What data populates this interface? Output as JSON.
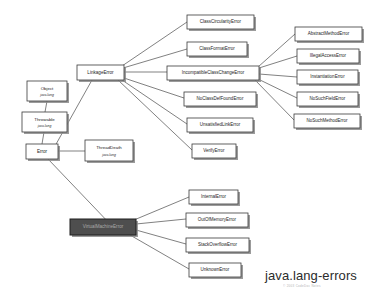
{
  "diagram": {
    "title": "java.lang-errors",
    "subtitle": "© 2003 CodeDoc Notes",
    "canvas": {
      "width": 373,
      "height": 301,
      "background": "#ffffff"
    },
    "style": {
      "box_fill": "#ffffff",
      "box_stroke": "#3a3a3a",
      "shadow_fill": "#8a8a8a",
      "edge_stroke": "#4a4a4a",
      "selected_fill": "#4e4e4e",
      "selected_text": "#a9a9a9"
    },
    "nodes": [
      {
        "id": "object",
        "label": "Object",
        "sublabel": "java.lang",
        "x": 27,
        "y": 81,
        "w": 40,
        "h": 20,
        "selected": false,
        "font": 4.4,
        "subfont": 3.4
      },
      {
        "id": "throwable",
        "label": "Throwable",
        "sublabel": "java.lang",
        "x": 22,
        "y": 112,
        "w": 45,
        "h": 20,
        "selected": false,
        "font": 4.4,
        "subfont": 3.4
      },
      {
        "id": "error",
        "label": "Error",
        "sublabel": "",
        "x": 26,
        "y": 144,
        "w": 32,
        "h": 15,
        "selected": false,
        "font": 4.6,
        "subfont": 0
      },
      {
        "id": "threaddeath",
        "label": "ThreadDeath",
        "sublabel": "java.lang",
        "x": 85,
        "y": 140,
        "w": 48,
        "h": 21,
        "selected": false,
        "font": 4.4,
        "subfont": 3.4
      },
      {
        "id": "linkageerror",
        "label": "LinkageError",
        "sublabel": "",
        "x": 77,
        "y": 65,
        "w": 47,
        "h": 15,
        "selected": false,
        "font": 4.6,
        "subfont": 0
      },
      {
        "id": "classcircularityerror",
        "label": "ClassCircularityError",
        "sublabel": "",
        "x": 187,
        "y": 15,
        "w": 67,
        "h": 14,
        "selected": false,
        "font": 4.5,
        "subfont": 0
      },
      {
        "id": "classformaterror",
        "label": "ClassFormatError",
        "sublabel": "",
        "x": 187,
        "y": 42,
        "w": 60,
        "h": 14,
        "selected": false,
        "font": 4.5,
        "subfont": 0
      },
      {
        "id": "incompatibleclasschangeerror",
        "label": "IncompatibleClassChangeError",
        "sublabel": "",
        "x": 167,
        "y": 66,
        "w": 92,
        "h": 14,
        "selected": false,
        "font": 4.5,
        "subfont": 0
      },
      {
        "id": "noclassdeffounderror",
        "label": "NoClassDefFoundError",
        "sublabel": "",
        "x": 184,
        "y": 92,
        "w": 72,
        "h": 14,
        "selected": false,
        "font": 4.5,
        "subfont": 0
      },
      {
        "id": "unsatisfiedlinkerror",
        "label": "UnsatisfiedLinkError",
        "sublabel": "",
        "x": 187,
        "y": 118,
        "w": 66,
        "h": 14,
        "selected": false,
        "font": 4.5,
        "subfont": 0
      },
      {
        "id": "verifyerror",
        "label": "VerifyError",
        "sublabel": "",
        "x": 192,
        "y": 144,
        "w": 44,
        "h": 14,
        "selected": false,
        "font": 4.5,
        "subfont": 0
      },
      {
        "id": "abstractmethoderror",
        "label": "AbstractMethodError",
        "sublabel": "",
        "x": 295,
        "y": 27,
        "w": 67,
        "h": 14,
        "selected": false,
        "font": 4.5,
        "subfont": 0
      },
      {
        "id": "illegalaccesserror",
        "label": "IllegalAccessError",
        "sublabel": "",
        "x": 297,
        "y": 49,
        "w": 62,
        "h": 14,
        "selected": false,
        "font": 4.5,
        "subfont": 0
      },
      {
        "id": "instantiationerror",
        "label": "InstantiationError",
        "sublabel": "",
        "x": 297,
        "y": 70,
        "w": 61,
        "h": 14,
        "selected": false,
        "font": 4.5,
        "subfont": 0
      },
      {
        "id": "nosuchfielderror",
        "label": "NoSuchFieldError",
        "sublabel": "",
        "x": 297,
        "y": 92,
        "w": 61,
        "h": 14,
        "selected": false,
        "font": 4.5,
        "subfont": 0
      },
      {
        "id": "nosuchmethoderror",
        "label": "NoSuchMethodError",
        "sublabel": "",
        "x": 294,
        "y": 114,
        "w": 66,
        "h": 14,
        "selected": false,
        "font": 4.5,
        "subfont": 0
      },
      {
        "id": "virtualmachineerror",
        "label": "VirtualMachineError",
        "sublabel": "",
        "x": 70,
        "y": 219,
        "w": 66,
        "h": 16,
        "selected": true,
        "font": 4.6,
        "subfont": 0
      },
      {
        "id": "internalerror",
        "label": "InternalError",
        "sublabel": "",
        "x": 189,
        "y": 190,
        "w": 49,
        "h": 14,
        "selected": false,
        "font": 4.5,
        "subfont": 0
      },
      {
        "id": "outofmemoryerror",
        "label": "OutOfMemoryError",
        "sublabel": "",
        "x": 186,
        "y": 213,
        "w": 62,
        "h": 14,
        "selected": false,
        "font": 4.5,
        "subfont": 0
      },
      {
        "id": "stackoverflowerror",
        "label": "StackOverflowError",
        "sublabel": "",
        "x": 186,
        "y": 238,
        "w": 63,
        "h": 14,
        "selected": false,
        "font": 4.5,
        "subfont": 0
      },
      {
        "id": "unknownerror",
        "label": "UnknownError",
        "sublabel": "",
        "x": 189,
        "y": 263,
        "w": 52,
        "h": 14,
        "selected": false,
        "font": 4.5,
        "subfont": 0
      }
    ],
    "edges": [
      {
        "id": "object-throwable",
        "from": "object",
        "to": "throwable",
        "x1": 47,
        "y1": 101,
        "x2": 45,
        "y2": 112
      },
      {
        "id": "throwable-error",
        "from": "throwable",
        "to": "error",
        "x1": 44,
        "y1": 132,
        "x2": 42,
        "y2": 144
      },
      {
        "id": "error-threaddeath",
        "from": "error",
        "to": "threaddeath",
        "x1": 58,
        "y1": 151,
        "x2": 85,
        "y2": 151
      },
      {
        "id": "error-linkageerror",
        "from": "error",
        "to": "linkageerror",
        "x1": 55,
        "y1": 146,
        "x2": 92,
        "y2": 80
      },
      {
        "id": "error-virtualmachineerror",
        "from": "error",
        "to": "virtualmachineerror",
        "x1": 48,
        "y1": 159,
        "x2": 112,
        "y2": 226
      },
      {
        "id": "linkage-classcircularity",
        "from": "linkageerror",
        "to": "classcircularityerror",
        "x1": 122,
        "y1": 66,
        "x2": 187,
        "y2": 22
      },
      {
        "id": "linkage-classformat",
        "from": "linkageerror",
        "to": "classformaterror",
        "x1": 123,
        "y1": 68,
        "x2": 187,
        "y2": 49
      },
      {
        "id": "linkage-incompatible",
        "from": "linkageerror",
        "to": "incompatibleclasschangeerror",
        "x1": 124,
        "y1": 72,
        "x2": 167,
        "y2": 72
      },
      {
        "id": "linkage-noclassdef",
        "from": "linkageerror",
        "to": "noclassdeffounderror",
        "x1": 124,
        "y1": 78,
        "x2": 184,
        "y2": 98
      },
      {
        "id": "linkage-unsatisfiedlink",
        "from": "linkageerror",
        "to": "unsatisfiedlinkerror",
        "x1": 122,
        "y1": 80,
        "x2": 187,
        "y2": 124
      },
      {
        "id": "linkage-verify",
        "from": "linkageerror",
        "to": "verifyerror",
        "x1": 118,
        "y1": 80,
        "x2": 192,
        "y2": 150
      },
      {
        "id": "incompatible-abstractmethod",
        "from": "incompatibleclasschangeerror",
        "to": "abstractmethoderror",
        "x1": 258,
        "y1": 67,
        "x2": 295,
        "y2": 34
      },
      {
        "id": "incompatible-illegalaccess",
        "from": "incompatibleclasschangeerror",
        "to": "illegalaccesserror",
        "x1": 259,
        "y1": 68,
        "x2": 297,
        "y2": 56
      },
      {
        "id": "incompatible-instantiation",
        "from": "incompatibleclasschangeerror",
        "to": "instantiationerror",
        "x1": 259,
        "y1": 74,
        "x2": 297,
        "y2": 77
      },
      {
        "id": "incompatible-nosuchfield",
        "from": "incompatibleclasschangeerror",
        "to": "nosuchfielderror",
        "x1": 258,
        "y1": 79,
        "x2": 297,
        "y2": 98
      },
      {
        "id": "incompatible-nosuchmethod",
        "from": "incompatibleclasschangeerror",
        "to": "nosuchmethoderror",
        "x1": 255,
        "y1": 80,
        "x2": 294,
        "y2": 120
      },
      {
        "id": "vme-internalerror",
        "from": "virtualmachineerror",
        "to": "internalerror",
        "x1": 134,
        "y1": 220,
        "x2": 189,
        "y2": 197
      },
      {
        "id": "vme-outofmemory",
        "from": "virtualmachineerror",
        "to": "outofmemoryerror",
        "x1": 136,
        "y1": 224,
        "x2": 186,
        "y2": 219
      },
      {
        "id": "vme-stackoverflow",
        "from": "virtualmachineerror",
        "to": "stackoverflowerror",
        "x1": 136,
        "y1": 230,
        "x2": 186,
        "y2": 244
      },
      {
        "id": "vme-unknownerror",
        "from": "virtualmachineerror",
        "to": "unknownerror",
        "x1": 130,
        "y1": 235,
        "x2": 189,
        "y2": 269
      }
    ],
    "caption": {
      "x": 265,
      "y": 268,
      "sub_x": 283,
      "sub_y": 284
    }
  }
}
